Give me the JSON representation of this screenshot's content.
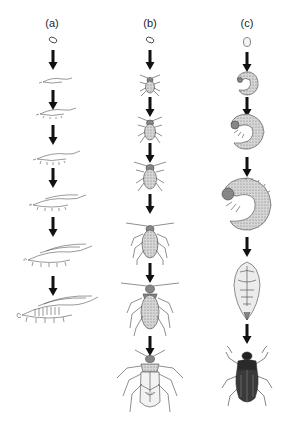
{
  "figure": {
    "columns": [
      {
        "id": "a",
        "label": "(a)",
        "type": "ametabolous",
        "stages": [
          "egg",
          "juvenile 1",
          "juvenile 2",
          "juvenile 3",
          "juvenile 4",
          "juvenile 5",
          "adult"
        ]
      },
      {
        "id": "b",
        "label": "(b)",
        "type": "hemimetabolous",
        "stages": [
          "egg",
          "nymph 1",
          "nymph 2",
          "nymph 3",
          "nymph 4",
          "nymph 5",
          "adult"
        ]
      },
      {
        "id": "c",
        "label": "(c)",
        "type": "holometabolous",
        "stages": [
          "egg",
          "larva 1",
          "larva 2",
          "larva 3",
          "pupa",
          "adult"
        ]
      }
    ],
    "colors": {
      "line": "#333333",
      "arrow": "#111111",
      "fill_light": "#e8e8e8",
      "fill_mid": "#b8b8b8",
      "fill_dark": "#2a2a2a",
      "background": "#ffffff"
    }
  }
}
